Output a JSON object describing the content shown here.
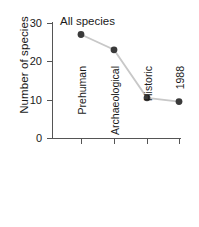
{
  "chart_data": {
    "type": "line",
    "title": "All species",
    "xlabel": "",
    "ylabel": "Number of species",
    "categories": [
      "Prehuman",
      "Archaeological",
      "Historic",
      "1988"
    ],
    "values": [
      27,
      23,
      10.5,
      9.5
    ],
    "series": [
      {
        "name": "All species",
        "values": [
          27,
          23,
          10.5,
          9.5
        ]
      }
    ],
    "ylim": [
      0,
      30
    ],
    "yticks": [
      0,
      10,
      20,
      30
    ],
    "ytick_labels": [
      "0",
      "10",
      "20",
      "30"
    ],
    "grid": false,
    "legend": false,
    "marker": "filled-circle",
    "marker_color": "#3a3a3a",
    "line_color": "#c8c8c8",
    "axis_color": "#555555",
    "background": "#ffffff"
  },
  "axes": {
    "y_title": "Number of species",
    "y_ticks": [
      {
        "label": "30",
        "value": 30
      },
      {
        "label": "20",
        "value": 20
      },
      {
        "label": "10",
        "value": 10
      },
      {
        "label": "0",
        "value": 0
      }
    ],
    "x_ticks": [
      {
        "label": "Prehuman"
      },
      {
        "label": "Archaeological"
      },
      {
        "label": "Historic"
      },
      {
        "label": "1988"
      }
    ]
  },
  "annotation": {
    "title": "All species"
  }
}
